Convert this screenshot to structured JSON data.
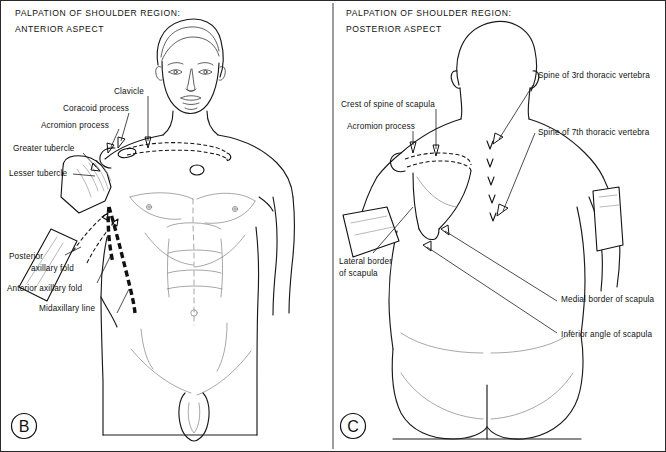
{
  "figure": {
    "kind": "anatomy-plate",
    "background_color": "#ffffff",
    "ink_color": "#111111",
    "panels": [
      {
        "id": "B",
        "letter": "B",
        "title_line1": "PALPATION OF SHOULDER REGION:",
        "title_line2": "ANTERIOR ASPECT",
        "labels": [
          {
            "key": "clavicle",
            "text": "Clavicle",
            "lines": [
              "Clavicle"
            ]
          },
          {
            "key": "coracoid-process",
            "text": "Coracoid process",
            "lines": [
              "Coracoid process"
            ]
          },
          {
            "key": "acromion-process",
            "text": "Acromion process",
            "lines": [
              "Acromion process"
            ]
          },
          {
            "key": "greater-tubercle",
            "text": "Greater tubercle",
            "lines": [
              "Greater tubercle"
            ]
          },
          {
            "key": "lesser-tubercle",
            "text": "Lesser tubercle",
            "lines": [
              "Lesser tubercle"
            ]
          },
          {
            "key": "posterior-axillary-fold",
            "text": "Posterior axillary fold",
            "lines": [
              "Posterior",
              "axillary fold"
            ]
          },
          {
            "key": "anterior-axillary-fold",
            "text": "Anterior axillary fold",
            "lines": [
              "Anterior axillary fold"
            ]
          },
          {
            "key": "midaxillary-line",
            "text": "Midaxillary line",
            "lines": [
              "Midaxillary line"
            ]
          }
        ]
      },
      {
        "id": "C",
        "letter": "C",
        "title_line1": "PALPATION OF SHOULDER REGION:",
        "title_line2": "POSTERIOR ASPECT",
        "labels": [
          {
            "key": "crest-of-spine-of-scapula",
            "text": "Crest of spine of scapula",
            "lines": [
              "Crest of spine of scapula"
            ]
          },
          {
            "key": "acromion-process",
            "text": "Acromion process",
            "lines": [
              "Acromion process"
            ]
          },
          {
            "key": "spine-3rd-thoracic-vertebra",
            "text": "Spine of 3rd thoracic vertebra",
            "lines": [
              "Spine of 3rd thoracic vertebra"
            ]
          },
          {
            "key": "spine-7th-thoracic-vertebra",
            "text": "Spine of 7th thoracic vertebra",
            "lines": [
              "Spine of 7th thoracic vertebra"
            ]
          },
          {
            "key": "lateral-border-of-scapula",
            "text": "Lateral border of scapula",
            "lines": [
              "Lateral border",
              "of scapula"
            ]
          },
          {
            "key": "medial-border-of-scapula",
            "text": "Medial border of scapula",
            "lines": [
              "Medial border of scapula"
            ]
          },
          {
            "key": "inferior-angle-of-scapula",
            "text": "Inferior angle of scapula",
            "lines": [
              "Inferior angle of scapula"
            ]
          }
        ]
      }
    ]
  }
}
